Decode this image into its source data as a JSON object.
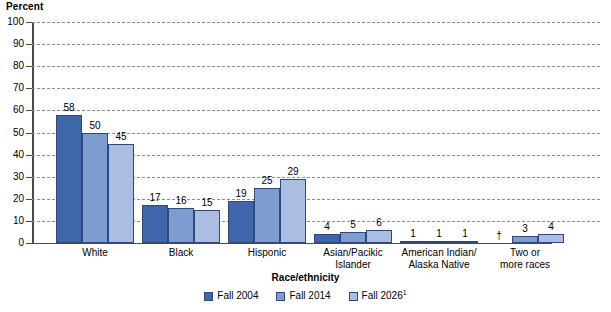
{
  "chart_data": {
    "type": "bar",
    "title": "",
    "xlabel": "Race/ethnicity",
    "ylabel": "Percent",
    "ylim": [
      0,
      100
    ],
    "ytick_step": 10,
    "yticks": [
      "100",
      "90",
      "80",
      "70",
      "60",
      "50",
      "40",
      "30",
      "20",
      "10",
      "0"
    ],
    "grid": true,
    "legend_position": "bottom",
    "categories": [
      "White",
      "Black",
      "Hisponic",
      "Asian/Pacikic Islander",
      "American Indian/ Alaska Native",
      "Two or more races"
    ],
    "category_lines": [
      [
        "White"
      ],
      [
        "Black"
      ],
      [
        "Hisponic"
      ],
      [
        "Asian/Pacikic",
        "Islander"
      ],
      [
        "American Indian/",
        "Alaska Native"
      ],
      [
        "Two or",
        "more races"
      ]
    ],
    "series": [
      {
        "name": "Fall 2004",
        "color": "#3f66a8",
        "values": [
          58,
          17,
          19,
          4,
          1,
          null
        ],
        "labels": [
          "58",
          "17",
          "19",
          "4",
          "1",
          "†"
        ]
      },
      {
        "name": "Fall 2014",
        "color": "#7e9cd0",
        "values": [
          50,
          16,
          25,
          5,
          1,
          3
        ],
        "labels": [
          "50",
          "16",
          "25",
          "5",
          "1",
          "3"
        ]
      },
      {
        "name": "Fall 2026",
        "color": "#abbde3",
        "values": [
          45,
          15,
          29,
          6,
          1,
          4
        ],
        "labels": [
          "45",
          "15",
          "29",
          "6",
          "1",
          "4"
        ]
      }
    ],
    "legend": [
      {
        "label": "Fall 2004",
        "sup": "",
        "color": "#3f66a8"
      },
      {
        "label": "Fall 2014",
        "sup": "",
        "color": "#7e9cd0"
      },
      {
        "label": "Fall 2026",
        "sup": "1",
        "color": "#abbde3"
      }
    ]
  }
}
